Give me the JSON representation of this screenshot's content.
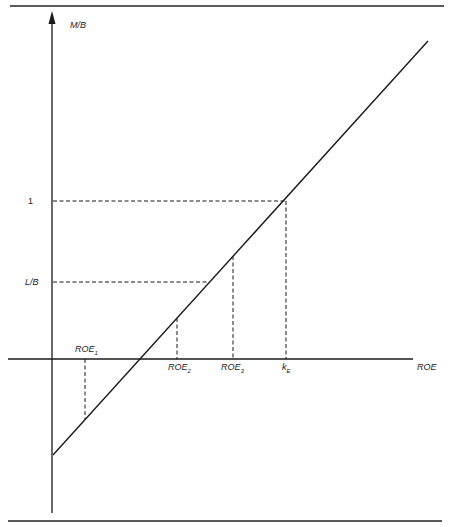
{
  "diagram": {
    "y_axis_label": "M/B",
    "x_axis_label": "ROE",
    "y_ticks": [
      {
        "label": "1"
      },
      {
        "label": "L/B"
      }
    ],
    "x_marks": [
      {
        "base": "ROE",
        "sub": "1"
      },
      {
        "base": "ROE",
        "sub": "2"
      },
      {
        "base": "ROE",
        "sub": "3"
      },
      {
        "base": "k",
        "sub": "E"
      }
    ],
    "colors": {
      "line": "#1a1a1a",
      "background": "#ffffff"
    }
  }
}
